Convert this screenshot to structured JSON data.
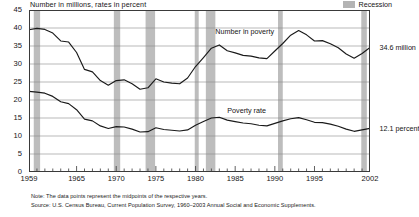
{
  "chart_data": {
    "type": "line",
    "title": "Number in millions, rates in percent",
    "xlabel": "",
    "ylabel": "Number in millions, rates in percent",
    "ylim": [
      0,
      45
    ],
    "ytick_step": 5,
    "yticks": [
      "0",
      "5",
      "10",
      "15",
      "20",
      "25",
      "30",
      "35",
      "40",
      "45"
    ],
    "xlim": [
      1959,
      2002
    ],
    "xticks": [
      "1959",
      "1965",
      "1970",
      "1975",
      "1980",
      "1985",
      "1990",
      "1995",
      "2002"
    ],
    "xtick_values": [
      1959,
      1965,
      1970,
      1975,
      1980,
      1985,
      1990,
      1995,
      2002
    ],
    "grid": true,
    "legend_position": "top-right",
    "legend": [
      {
        "label": "Recession",
        "color": "#b4b4b4",
        "type": "band"
      }
    ],
    "annotations": [
      {
        "label": "Number in poverty",
        "x": 1982.5,
        "y": 39.2
      },
      {
        "label": "Poverty rate",
        "x": 1984.0,
        "y": 17.2
      },
      {
        "label": "34.6 million",
        "x": 2003.2,
        "y": 34.6
      },
      {
        "label": "12.1 percent",
        "x": 2003.2,
        "y": 12.1
      }
    ],
    "x": [
      1959,
      1960,
      1961,
      1962,
      1963,
      1964,
      1965,
      1966,
      1967,
      1968,
      1969,
      1970,
      1971,
      1972,
      1973,
      1974,
      1975,
      1976,
      1977,
      1978,
      1979,
      1980,
      1981,
      1982,
      1983,
      1984,
      1985,
      1986,
      1987,
      1988,
      1989,
      1990,
      1991,
      1992,
      1993,
      1994,
      1995,
      1996,
      1997,
      1998,
      1999,
      2000,
      2001,
      2002
    ],
    "series": [
      {
        "name": "Number in poverty",
        "units": "millions",
        "end_label": "34.6 million",
        "color": "#1a1a1a",
        "values": [
          39.5,
          39.9,
          39.6,
          38.6,
          36.4,
          36.1,
          33.2,
          28.5,
          27.8,
          25.4,
          24.1,
          25.4,
          25.6,
          24.5,
          23.0,
          23.4,
          25.9,
          25.0,
          24.7,
          24.5,
          26.1,
          29.3,
          31.8,
          34.4,
          35.3,
          33.7,
          33.1,
          32.4,
          32.2,
          31.7,
          31.5,
          33.6,
          35.7,
          38.0,
          39.3,
          38.1,
          36.4,
          36.5,
          35.6,
          34.5,
          32.8,
          31.6,
          32.9,
          34.6
        ]
      },
      {
        "name": "Poverty rate",
        "units": "percent",
        "end_label": "12.1 percent",
        "color": "#1a1a1a",
        "values": [
          22.4,
          22.2,
          21.9,
          21.0,
          19.5,
          19.0,
          17.3,
          14.7,
          14.2,
          12.8,
          12.1,
          12.6,
          12.5,
          11.9,
          11.1,
          11.2,
          12.3,
          11.8,
          11.6,
          11.4,
          11.7,
          13.0,
          14.0,
          15.0,
          15.2,
          14.4,
          14.0,
          13.6,
          13.4,
          13.0,
          12.8,
          13.5,
          14.2,
          14.8,
          15.1,
          14.5,
          13.8,
          13.7,
          13.3,
          12.7,
          11.9,
          11.3,
          11.7,
          12.1
        ]
      }
    ],
    "recession_bands": [
      {
        "start": 1959.6,
        "end": 1960.4
      },
      {
        "start": 1969.7,
        "end": 1970.5
      },
      {
        "start": 1973.7,
        "end": 1974.9
      },
      {
        "start": 1979.9,
        "end": 1980.4
      },
      {
        "start": 1981.3,
        "end": 1982.5
      },
      {
        "start": 1990.4,
        "end": 1991.0
      },
      {
        "start": 2000.9,
        "end": 2001.6
      }
    ]
  },
  "notes": {
    "note_line": "Note:  The data points represent the midpoints of the respective years.",
    "source_line": "Source:  U.S. Census Bureau, Current Population Survey, 1960–2003 Annual Social and Economic Supplements."
  }
}
